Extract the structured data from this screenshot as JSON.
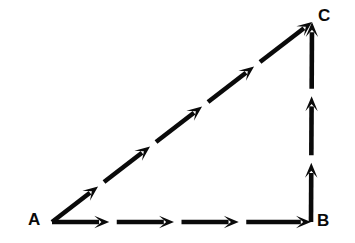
{
  "figure": {
    "name": "vector-addition-triangle",
    "background_color": "#ffffff",
    "stroke_color": "#0a0a0a",
    "stroke_width": 4.6,
    "labels": {
      "a": "A",
      "b": "B",
      "c": "C"
    }
  },
  "chart_data": {
    "type": "diagram",
    "title": "",
    "subtitle": "",
    "xlabel": "",
    "ylabel": "",
    "grid": false,
    "legend": null,
    "vertices": [
      {
        "name": "A",
        "label": "A",
        "x": 52,
        "y": 222,
        "label_x": 33,
        "label_y": 221
      },
      {
        "name": "B",
        "label": "B",
        "x": 311,
        "y": 222,
        "label_x": 322,
        "label_y": 221
      },
      {
        "name": "C",
        "label": "C",
        "x": 312,
        "y": 22,
        "label_x": 324,
        "label_y": 17
      }
    ],
    "edges": [
      {
        "name": "vector-ab",
        "from": "A",
        "to": "B",
        "direction": "right",
        "arrow_segments": 4,
        "x1": 52,
        "y1": 222,
        "x2": 311,
        "y2": 222
      },
      {
        "name": "vector-bc",
        "from": "B",
        "to": "C",
        "direction": "up",
        "arrow_segments": 3,
        "x1": 311,
        "y1": 222,
        "x2": 312,
        "y2": 22
      },
      {
        "name": "vector-ac",
        "from": "A",
        "to": "C",
        "direction": "up-right",
        "arrow_segments": 5,
        "x1": 52,
        "y1": 222,
        "x2": 312,
        "y2": 22
      }
    ],
    "axis_ranges": {
      "x": [
        0,
        355
      ],
      "y": [
        0,
        243
      ]
    }
  }
}
